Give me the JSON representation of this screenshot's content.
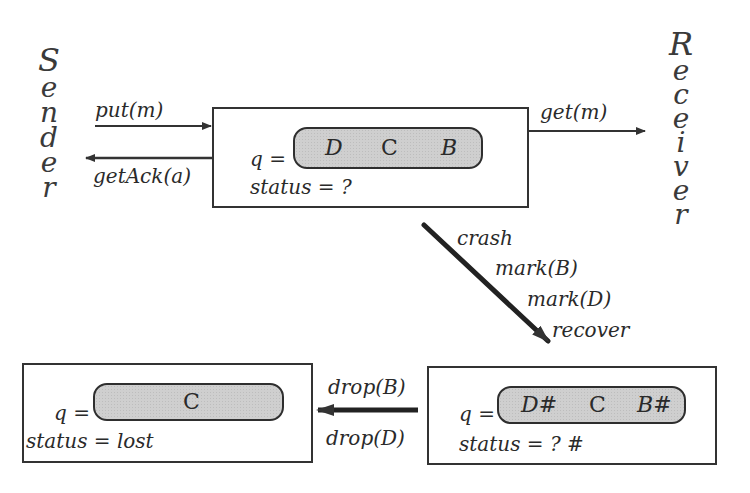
{
  "actors": {
    "sender": {
      "label": "Sender",
      "letters": [
        "S",
        "e",
        "n",
        "d",
        "e",
        "r"
      ]
    },
    "receiver": {
      "label": "Receiver",
      "letters": [
        "R",
        "e",
        "c",
        "e",
        "i",
        "v",
        "e",
        "r"
      ]
    }
  },
  "states": {
    "initial": {
      "queue_label": "q =",
      "queue": [
        "D",
        "C",
        "B"
      ],
      "status_text": "status = ?"
    },
    "recovered": {
      "queue_label": "q =",
      "queue": [
        "D#",
        "C",
        "B#"
      ],
      "status_text": "status = ? #"
    },
    "lost": {
      "queue_label": "q =",
      "queue": [
        "C"
      ],
      "status_text": "status = lost"
    }
  },
  "transitions": {
    "put": "put(m)",
    "get_ack": "getAck(a)",
    "get": "get(m)",
    "crash_sequence": [
      "crash",
      "mark(B)",
      "mark(D)",
      "recover"
    ],
    "drop_sequence": [
      "drop(B)",
      "drop(D)"
    ]
  },
  "colors": {
    "line": "#333333",
    "pill_fill": "#cfcfcf",
    "text": "#2a2a2a"
  }
}
